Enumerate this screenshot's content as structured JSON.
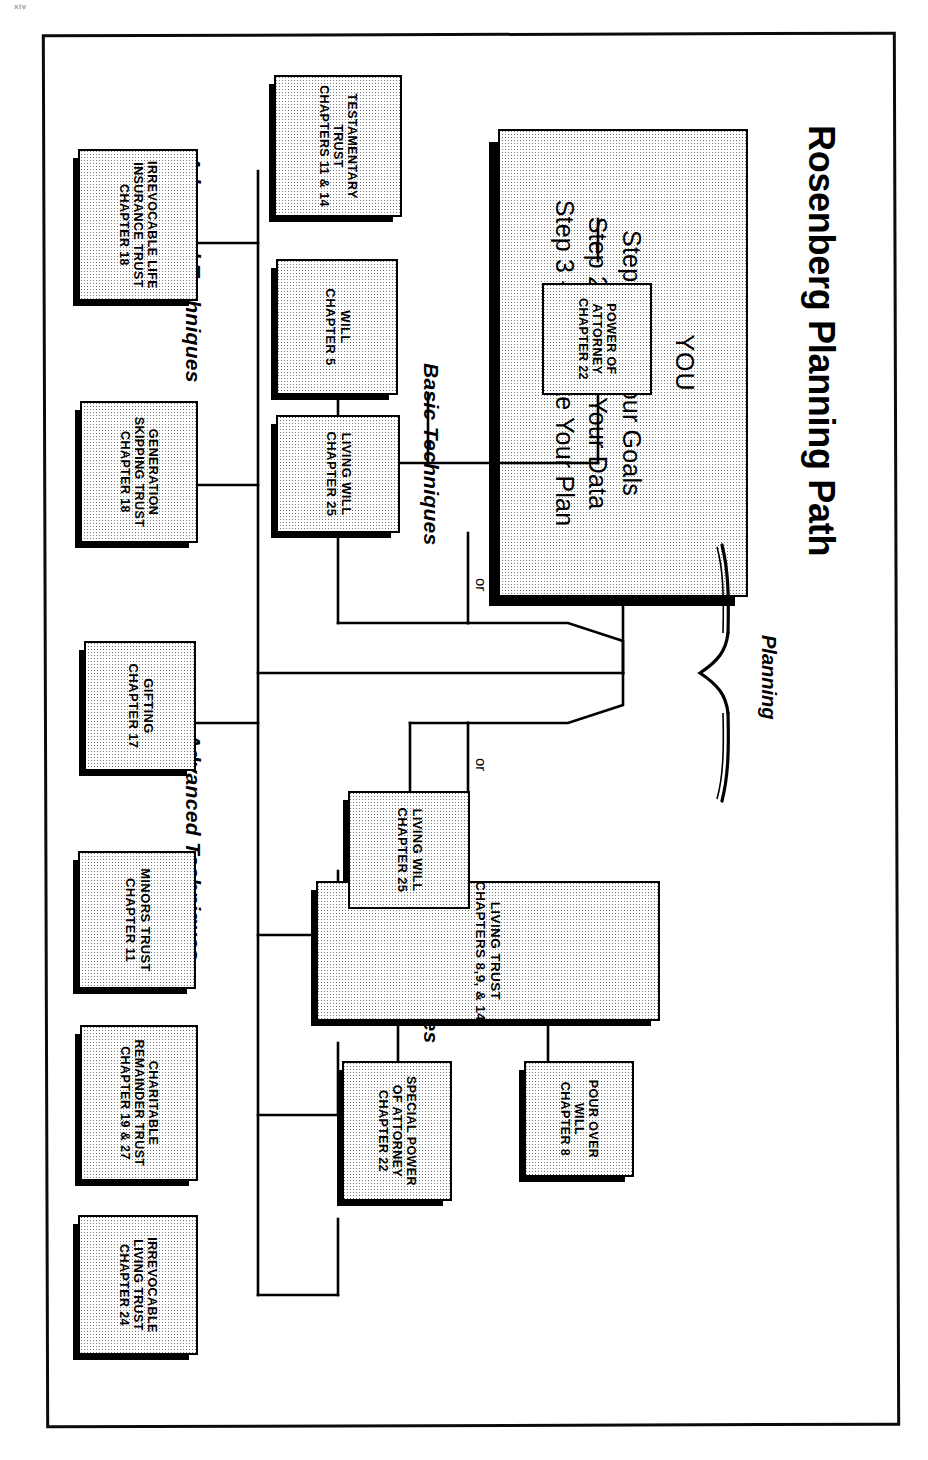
{
  "page": {
    "folio": "xiv"
  },
  "diagram": {
    "title": "Rosenberg Planning Path",
    "planning_label": "Planning",
    "or_label_1": "or",
    "or_label_2": "or",
    "captions": {
      "basic_top": "Basic Techniques",
      "basic_bottom": "Basic Techniques",
      "advanced_top": "Advanced Techniques",
      "advanced_bottom": "Advanced Techniques"
    },
    "root": {
      "heading": "YOU",
      "steps": [
        "Step 1 - Set Your Goals",
        "Step 2 - Gather Your Data",
        "Step 3 - Formulate Your Plan"
      ]
    },
    "nodes": {
      "living_trust": {
        "lines": [
          "LIVING TRUST",
          "CHAPTERS 8,9, & 14"
        ]
      },
      "pour_over_will": {
        "lines": [
          "POUR OVER",
          "WILL",
          "CHAPTER 8"
        ]
      },
      "special_poa": {
        "lines": [
          "SPECIAL POWER",
          "OF ATTORNEY",
          "CHAPTER 22"
        ]
      },
      "living_will_top": {
        "lines": [
          "LIVING WILL",
          "CHAPTER 25"
        ]
      },
      "will": {
        "lines": [
          "WILL",
          "CHAPTER 5"
        ]
      },
      "power_of_attorney": {
        "lines": [
          "POWER OF",
          "ATTORNEY",
          "CHAPTER 22"
        ]
      },
      "testamentary_trust": {
        "lines": [
          "TESTAMENTARY",
          "TRUST",
          "CHAPTERS 11 & 14"
        ]
      },
      "living_will_bottom": {
        "lines": [
          "LIVING WILL",
          "CHAPTER 25"
        ]
      },
      "irrev_living_trust": {
        "lines": [
          "IRREVOCABLE",
          "LIVING TRUST",
          "CHAPTER 24"
        ]
      },
      "charitable_remainder": {
        "lines": [
          "CHARITABLE",
          "REMAINDER TRUST",
          "CHAPTER 19 & 27"
        ]
      },
      "minors_trust": {
        "lines": [
          "MINORS TRUST",
          "CHAPTER 11"
        ]
      },
      "gifting": {
        "lines": [
          "GIFTING",
          "CHAPTER 17"
        ]
      },
      "generation_skipping": {
        "lines": [
          "GENERATION",
          "SKIPPING TRUST",
          "CHAPTER 18"
        ]
      },
      "irrev_life_ins": {
        "lines": [
          "IRREVOCABLE LIFE",
          "INSURANCE TRUST",
          "CHAPTER 18"
        ]
      }
    },
    "colors": {
      "ink": "#000000",
      "paper": "#ffffff",
      "fill": "#e9e9e9"
    }
  }
}
